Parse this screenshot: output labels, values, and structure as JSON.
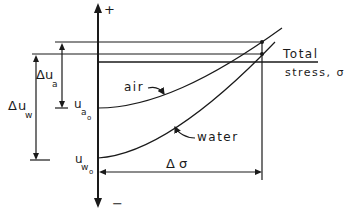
{
  "diagram": {
    "axis": {
      "positive_label": "+",
      "negative_label": "−"
    },
    "total_stress_label_line1": "Total",
    "total_stress_label_line2": "stress, σ",
    "curves": [
      {
        "name": "air",
        "label": "air",
        "start_label": {
          "base": "u",
          "sub": "a",
          "subsub": "o"
        }
      },
      {
        "name": "water",
        "label": "water",
        "start_label": {
          "base": "u",
          "sub": "w",
          "subsub": "o"
        }
      }
    ],
    "delta_ua": {
      "delta": "Δ",
      "base": "u",
      "sub": "a"
    },
    "delta_uw": {
      "delta": "Δ",
      "base": "u",
      "sub": "w"
    },
    "delta_sigma": "Δ σ",
    "color": "#1a1a1a"
  }
}
